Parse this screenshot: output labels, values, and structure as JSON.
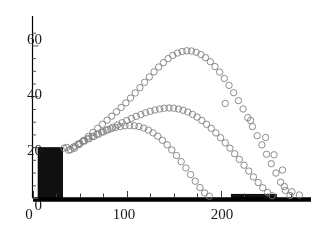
{
  "chart_data": {
    "type": "scatter",
    "title": "",
    "subtitle": "",
    "xlabel": "",
    "ylabel": "",
    "xlim": [
      0,
      290
    ],
    "ylim": [
      0,
      70
    ],
    "grid": false,
    "legend_position": "none",
    "x_ticks_major": [
      0,
      100,
      200
    ],
    "x_tick_labels": [
      "0",
      "100",
      "200"
    ],
    "x_ticks_minor": [
      25,
      50,
      75,
      125,
      150,
      175,
      225,
      250,
      275
    ],
    "y_ticks_major": [
      0,
      20,
      40,
      60
    ],
    "y_tick_labels": [
      "0",
      "20",
      "40",
      "60"
    ],
    "y_ticks_minor": [
      5,
      10,
      15,
      25,
      30,
      35,
      45,
      50,
      55,
      65
    ],
    "axis_color": "#000000",
    "marker_color": "#808080",
    "marker_style": "open-circle",
    "marker_size": 3.2,
    "bar_color": "#101010",
    "bars": [
      {
        "x_start": 5,
        "x_end": 32,
        "height": 20
      },
      {
        "x_start": 211,
        "x_end": 260,
        "height": 1.6
      }
    ],
    "series": [
      {
        "name": "upper-arc",
        "color": "#808080",
        "points": [
          [
            44,
            19.5
          ],
          [
            49,
            21.0
          ],
          [
            54,
            22.6
          ],
          [
            59,
            24.2
          ],
          [
            64,
            25.8
          ],
          [
            69,
            27.4
          ],
          [
            74,
            29.0
          ],
          [
            79,
            30.6
          ],
          [
            84,
            32.2
          ],
          [
            89,
            33.9
          ],
          [
            94,
            35.6
          ],
          [
            99,
            37.4
          ],
          [
            104,
            39.3
          ],
          [
            109,
            41.3
          ],
          [
            114,
            43.4
          ],
          [
            119,
            45.5
          ],
          [
            124,
            47.6
          ],
          [
            129,
            49.6
          ],
          [
            134,
            51.5
          ],
          [
            139,
            53.2
          ],
          [
            144,
            54.8
          ],
          [
            149,
            56.1
          ],
          [
            154,
            57.0
          ],
          [
            159,
            57.6
          ],
          [
            164,
            57.9
          ],
          [
            169,
            57.8
          ],
          [
            174,
            57.3
          ],
          [
            179,
            56.4
          ],
          [
            184,
            55.2
          ],
          [
            189,
            53.6
          ],
          [
            194,
            51.7
          ],
          [
            199,
            49.5
          ],
          [
            204,
            47.0
          ],
          [
            209,
            44.3
          ],
          [
            214,
            41.4
          ],
          [
            219,
            38.3
          ],
          [
            224,
            35.0
          ],
          [
            229,
            31.6
          ],
          [
            234,
            28.1
          ],
          [
            239,
            24.5
          ],
          [
            244,
            20.9
          ],
          [
            249,
            17.2
          ],
          [
            254,
            13.5
          ],
          [
            259,
            9.8
          ],
          [
            264,
            6.2
          ],
          [
            269,
            3.0
          ],
          [
            274,
            1.0
          ]
        ]
      },
      {
        "name": "middle-arc",
        "color": "#808080",
        "points": [
          [
            40,
            19.0
          ],
          [
            45,
            20.3
          ],
          [
            50,
            21.4
          ],
          [
            55,
            22.4
          ],
          [
            60,
            23.3
          ],
          [
            65,
            24.2
          ],
          [
            70,
            25.1
          ],
          [
            75,
            26.0
          ],
          [
            80,
            26.9
          ],
          [
            85,
            27.8
          ],
          [
            90,
            28.7
          ],
          [
            95,
            29.6
          ],
          [
            100,
            30.5
          ],
          [
            105,
            31.3
          ],
          [
            110,
            32.1
          ],
          [
            115,
            32.8
          ],
          [
            120,
            33.5
          ],
          [
            125,
            34.1
          ],
          [
            130,
            34.6
          ],
          [
            135,
            35.0
          ],
          [
            140,
            35.3
          ],
          [
            145,
            35.4
          ],
          [
            150,
            35.3
          ],
          [
            155,
            35.0
          ],
          [
            160,
            34.5
          ],
          [
            165,
            33.8
          ],
          [
            170,
            32.9
          ],
          [
            175,
            31.8
          ],
          [
            180,
            30.5
          ],
          [
            185,
            29.0
          ],
          [
            190,
            27.4
          ],
          [
            195,
            25.6
          ],
          [
            200,
            23.7
          ],
          [
            205,
            21.7
          ],
          [
            210,
            19.6
          ],
          [
            215,
            17.4
          ],
          [
            220,
            15.2
          ],
          [
            225,
            12.9
          ],
          [
            230,
            10.6
          ],
          [
            235,
            8.3
          ],
          [
            240,
            6.1
          ],
          [
            245,
            4.0
          ],
          [
            250,
            2.2
          ],
          [
            255,
            0.9
          ]
        ]
      },
      {
        "name": "lower-arc",
        "color": "#808080",
        "points": [
          [
            38,
            18.8
          ],
          [
            43,
            20.0
          ],
          [
            48,
            21.2
          ],
          [
            53,
            22.3
          ],
          [
            58,
            23.3
          ],
          [
            63,
            24.2
          ],
          [
            68,
            25.1
          ],
          [
            73,
            25.9
          ],
          [
            78,
            26.6
          ],
          [
            83,
            27.2
          ],
          [
            88,
            27.7
          ],
          [
            93,
            28.1
          ],
          [
            98,
            28.4
          ],
          [
            103,
            28.5
          ],
          [
            108,
            28.4
          ],
          [
            113,
            28.1
          ],
          [
            118,
            27.5
          ],
          [
            123,
            26.7
          ],
          [
            128,
            25.6
          ],
          [
            133,
            24.3
          ],
          [
            138,
            22.7
          ],
          [
            143,
            20.9
          ],
          [
            148,
            18.9
          ],
          [
            153,
            16.7
          ],
          [
            158,
            14.3
          ],
          [
            163,
            11.8
          ],
          [
            168,
            9.2
          ],
          [
            173,
            6.6
          ],
          [
            178,
            4.1
          ],
          [
            183,
            2.0
          ],
          [
            188,
            0.7
          ]
        ]
      }
    ],
    "stray_points": [
      [
        33,
        19.6
      ],
      [
        36,
        19.9
      ],
      [
        205,
        37.2
      ],
      [
        232,
        30.5
      ],
      [
        248,
        23.8
      ],
      [
        257,
        17.0
      ],
      [
        266,
        11.0
      ],
      [
        268,
        4.5
      ],
      [
        276,
        2.5
      ],
      [
        284,
        1.2
      ]
    ]
  }
}
